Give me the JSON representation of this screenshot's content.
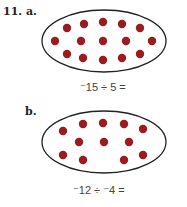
{
  "problem": {
    "number_label": "11. a.",
    "colors": {
      "counter": "#9b1b1e",
      "outline": "#222222"
    },
    "parts": [
      {
        "label": "a.",
        "expression": "⁻15 ÷ 5 =",
        "counter_count": 15
      },
      {
        "label": "b.",
        "expression": "⁻12 ÷ ⁻4 =",
        "counter_count": 12
      }
    ]
  }
}
